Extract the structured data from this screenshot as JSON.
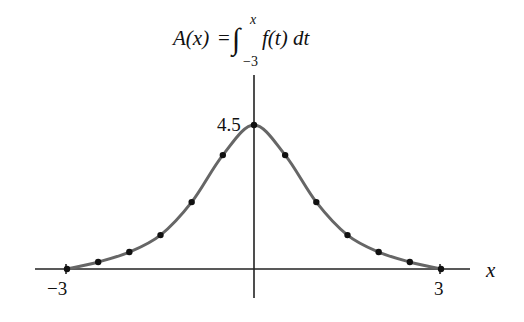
{
  "chart_data": {
    "type": "line",
    "title_parts": {
      "lhs": "A(x)",
      "equals": "=",
      "integral": "∫",
      "upper_limit": "x",
      "lower_limit": "−3",
      "integrand": "f(t) dt"
    },
    "xlabel": "x",
    "ylabel": "",
    "x_ticks": [
      {
        "value": -3,
        "label": "−3"
      },
      {
        "value": 3,
        "label": "3"
      }
    ],
    "y_ticks": [
      {
        "value": 4.5,
        "label": "4.5"
      }
    ],
    "xlim": [
      -3.5,
      3.5
    ],
    "ylim": [
      -0.9,
      6.1
    ],
    "grid": false,
    "legend": null,
    "series": [
      {
        "name": "A(x)",
        "color": "#666666",
        "marker_color": "#111111",
        "x": [
          -3,
          -2.5,
          -2,
          -1.5,
          -1,
          -0.5,
          0,
          0.5,
          1,
          1.5,
          2,
          2.5,
          3
        ],
        "values": [
          0,
          0.22,
          0.53,
          1.06,
          2.09,
          3.56,
          4.5,
          3.56,
          2.09,
          1.06,
          0.53,
          0.22,
          0
        ]
      }
    ]
  },
  "colors": {
    "axis": "#222222",
    "curve": "#666666",
    "points": "#111111",
    "background": "#ffffff"
  }
}
